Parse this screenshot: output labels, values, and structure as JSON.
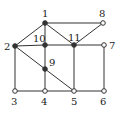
{
  "diagram": {
    "type": "undirected-graph",
    "nodes": [
      {
        "id": "1",
        "label": "1",
        "x": 45,
        "y": 23,
        "filled": true,
        "lx": 42,
        "ly": 17
      },
      {
        "id": "2",
        "label": "2",
        "x": 15,
        "y": 46,
        "filled": true,
        "lx": 4,
        "ly": 50
      },
      {
        "id": "3",
        "label": "3",
        "x": 15,
        "y": 91,
        "filled": false,
        "lx": 11,
        "ly": 105
      },
      {
        "id": "4",
        "label": "4",
        "x": 45,
        "y": 91,
        "filled": false,
        "lx": 41,
        "ly": 105
      },
      {
        "id": "5",
        "label": "5",
        "x": 74,
        "y": 91,
        "filled": false,
        "lx": 71,
        "ly": 105
      },
      {
        "id": "6",
        "label": "6",
        "x": 104,
        "y": 91,
        "filled": false,
        "lx": 100,
        "ly": 105
      },
      {
        "id": "7",
        "label": "7",
        "x": 104,
        "y": 45,
        "filled": false,
        "lx": 109,
        "ly": 49
      },
      {
        "id": "8",
        "label": "8",
        "x": 103,
        "y": 23,
        "filled": false,
        "lx": 99,
        "ly": 17
      },
      {
        "id": "9",
        "label": "9",
        "x": 45,
        "y": 69,
        "filled": true,
        "lx": 49,
        "ly": 66
      },
      {
        "id": "10",
        "label": "10",
        "x": 45,
        "y": 45,
        "filled": true,
        "lx": 33,
        "ly": 42
      },
      {
        "id": "11",
        "label": "11",
        "x": 74,
        "y": 45,
        "filled": true,
        "lx": 68,
        "ly": 41
      }
    ],
    "edges": [
      [
        "1",
        "2"
      ],
      [
        "1",
        "8"
      ],
      [
        "1",
        "10"
      ],
      [
        "1",
        "11"
      ],
      [
        "8",
        "11"
      ],
      [
        "2",
        "10"
      ],
      [
        "10",
        "11"
      ],
      [
        "11",
        "7"
      ],
      [
        "2",
        "3"
      ],
      [
        "2",
        "9"
      ],
      [
        "9",
        "5"
      ],
      [
        "10",
        "9"
      ],
      [
        "9",
        "4"
      ],
      [
        "3",
        "4"
      ],
      [
        "4",
        "5"
      ],
      [
        "5",
        "6"
      ],
      [
        "11",
        "5"
      ],
      [
        "7",
        "6"
      ]
    ]
  }
}
